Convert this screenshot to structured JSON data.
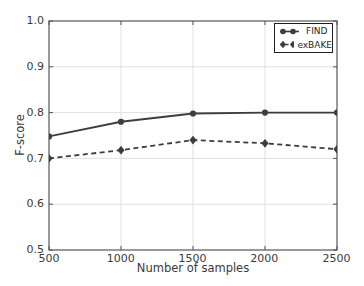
{
  "chart_data": {
    "type": "line",
    "title": "",
    "xlabel": "Number of samples",
    "ylabel": "F-score",
    "x": [
      500,
      1000,
      1500,
      2000,
      2500
    ],
    "series": [
      {
        "name": "FIND",
        "values": [
          0.748,
          0.78,
          0.798,
          0.8,
          0.8
        ],
        "line_style": "solid",
        "marker": "circle"
      },
      {
        "name": "exBAKE",
        "values": [
          0.7,
          0.718,
          0.74,
          0.733,
          0.72
        ],
        "line_style": "dashed",
        "marker": "diamond"
      }
    ],
    "xlim": [
      500,
      2500
    ],
    "ylim": [
      0.5,
      1.0
    ],
    "xticks": [
      500,
      1000,
      1500,
      2000,
      2500
    ],
    "yticks": [
      1.0,
      0.9,
      0.8,
      0.7,
      0.6,
      0.5
    ],
    "xtick_labels": [
      "500",
      "1000",
      "1500",
      "2000",
      "2500"
    ],
    "ytick_labels": [
      "1.0",
      "0.9",
      "0.8",
      "0.7",
      "0.6",
      "0.5"
    ],
    "grid": true,
    "legend_position": "upper-right",
    "colors": {
      "line": "#3d3d3d",
      "axis": "#565656",
      "grid": "#e0e0e0",
      "text": "#3a3a3a",
      "legend_border": "#1f1f1f",
      "background": "#ffffff"
    }
  }
}
